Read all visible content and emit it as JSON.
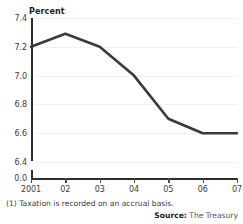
{
  "chart_data": {
    "type": "line",
    "title": "",
    "xlabel": "",
    "ylabel": "Percent",
    "categories": [
      "2001",
      "02",
      "03",
      "04",
      "05",
      "06",
      "07"
    ],
    "x_tick_labels": [
      "2001",
      "02",
      "03",
      "04",
      "05",
      "06",
      "07"
    ],
    "y_tick_labels": [
      "7.4",
      "7.2",
      "7.0",
      "6.8",
      "6.6",
      "6.4",
      "0.0"
    ],
    "y_gridline_values": [
      7.4,
      7.2,
      7.0,
      6.8,
      6.6,
      6.4
    ],
    "ylim": [
      6.4,
      7.4
    ],
    "y_axis_break": true,
    "y_axis_break_label": "0.0",
    "grid": true,
    "legend": "none",
    "series": [
      {
        "name": "Tax revenue",
        "color": "#3a3a3a",
        "values": [
          7.2,
          7.29,
          7.2,
          7.0,
          6.7,
          6.6,
          6.6
        ]
      }
    ]
  },
  "labels": {
    "axis_title": "Percent",
    "clipped_title": "",
    "footnote": "(1) Taxation is recorded on an accrual basis.",
    "source_prefix": "Source:",
    "source_value": "The Treasury"
  },
  "colors": {
    "line": "#3a3a3a",
    "axis": "#2e2e2e",
    "grid": "#f2f2f2",
    "text": "#3c3c3c",
    "background": "#ffffff"
  }
}
